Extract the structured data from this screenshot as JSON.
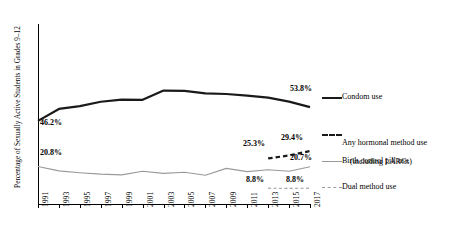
{
  "chart_data": {
    "type": "line",
    "title": "",
    "xlabel": "",
    "ylabel": "Percentage of Sexually Active Students in Grades 9–12",
    "x": [
      1991,
      1993,
      1995,
      1997,
      1999,
      2001,
      2003,
      2005,
      2007,
      2009,
      2011,
      2013,
      2015,
      2017
    ],
    "xlim": [
      1991,
      2017
    ],
    "ylim": [
      0,
      100
    ],
    "grid": false,
    "legend_position": "right",
    "series": [
      {
        "name": "Condom use",
        "style": "solid-thick-black",
        "color": "#1a1a1a",
        "x": [
          1991,
          1993,
          1995,
          1997,
          1999,
          2001,
          2003,
          2005,
          2007,
          2009,
          2011,
          2013,
          2015,
          2017
        ],
        "values": [
          46.2,
          52.8,
          54.4,
          56.8,
          58.0,
          57.9,
          63.0,
          62.8,
          61.5,
          61.1,
          60.2,
          59.1,
          56.9,
          53.8
        ]
      },
      {
        "name": "Any hormonal method use (including LARCs)",
        "style": "dashed-thick-black",
        "color": "#1a1a1a",
        "x": [
          2013,
          2015,
          2017
        ],
        "values": [
          25.3,
          27.0,
          29.4
        ]
      },
      {
        "name": "Birth control pill use",
        "style": "solid-thin-gray",
        "color": "#9a9a9a",
        "x": [
          1991,
          1993,
          1995,
          1997,
          1999,
          2001,
          2003,
          2005,
          2007,
          2009,
          2011,
          2013,
          2015,
          2017
        ],
        "values": [
          20.8,
          18.4,
          17.4,
          16.6,
          16.2,
          18.2,
          17.0,
          17.6,
          16.0,
          19.8,
          18.0,
          19.0,
          18.2,
          20.7
        ]
      },
      {
        "name": "Dual method use",
        "style": "dashed-thin-gray",
        "color": "#9a9a9a",
        "x": [
          2013,
          2015,
          2017
        ],
        "values": [
          8.8,
          8.7,
          8.8
        ]
      }
    ],
    "annotations": [
      {
        "text": "46.2%",
        "series": "Condom use",
        "x": 1991,
        "y": 46.2
      },
      {
        "text": "53.8%",
        "series": "Condom use",
        "x": 2017,
        "y": 53.8
      },
      {
        "text": "20.8%",
        "series": "Birth control pill use",
        "x": 1991,
        "y": 20.8
      },
      {
        "text": "20.7%",
        "series": "Birth control pill use",
        "x": 2017,
        "y": 20.7
      },
      {
        "text": "25.3%",
        "series": "Any hormonal method use (including LARCs)",
        "x": 2013,
        "y": 25.3
      },
      {
        "text": "29.4%",
        "series": "Any hormonal method use (including LARCs)",
        "x": 2017,
        "y": 29.4
      },
      {
        "text": "8.8%",
        "series": "Dual method use",
        "x": 2013,
        "y": 8.8
      },
      {
        "text": "8.8%",
        "series": "Dual method use",
        "x": 2017,
        "y": 8.8
      }
    ],
    "xtick_labels": [
      "1991",
      "1993",
      "1995",
      "1997",
      "1999",
      "2001",
      "2003",
      "2005",
      "2007",
      "2009",
      "2011",
      "2013",
      "2015",
      "2017"
    ],
    "legend": [
      {
        "label": "Condom use",
        "style": "solid-thick-black"
      },
      {
        "label": "Any hormonal method use\n(including LARCs)",
        "style": "dashed-thick-black"
      },
      {
        "label": "Birth control pill use",
        "style": "solid-thin-gray"
      },
      {
        "label": "Dual method use",
        "style": "dashed-thin-gray"
      }
    ]
  },
  "axis": {
    "y_title": "Percentage of Sexually Active Students in Grades 9–12"
  },
  "labels": {
    "condom_start": "46.2%",
    "condom_end": "53.8%",
    "pill_start": "20.8%",
    "pill_end": "20.7%",
    "hormonal_start": "25.3%",
    "hormonal_end": "29.4%",
    "dual_start": "8.8%",
    "dual_end": "8.8%"
  },
  "legend_labels": {
    "condom": "Condom use",
    "hormonal_l1": "Any hormonal method use",
    "hormonal_l2": "(including LARCs)",
    "pill": "Birth control pill use",
    "dual": "Dual method use"
  },
  "xticks": {
    "t0": "1991",
    "t1": "1993",
    "t2": "1995",
    "t3": "1997",
    "t4": "1999",
    "t5": "2001",
    "t6": "2003",
    "t7": "2005",
    "t8": "2007",
    "t9": "2009",
    "t10": "2011",
    "t11": "2013",
    "t12": "2015",
    "t13": "2017"
  }
}
